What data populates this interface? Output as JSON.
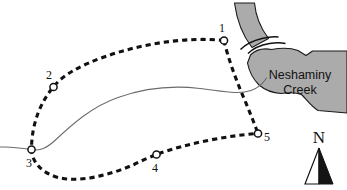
{
  "figure": {
    "name": "neshaminy-creek-sampling-site-map",
    "width": 347,
    "height": 190,
    "background_color": "#ffffff"
  },
  "colors": {
    "water_fill": "#ababab",
    "water_outline": "#1a1a1a",
    "route_line": "#111111",
    "stream_line": "#6b6b6b",
    "marker_fill": "#ffffff",
    "marker_stroke": "#111111",
    "text": "#111111"
  },
  "water_bodies": [
    {
      "name": "neshaminy-creek-upper-channel",
      "label": "",
      "fill": "#ababab"
    },
    {
      "name": "neshaminy-creek-lower-body",
      "label": "Neshaminy Creek",
      "label_line_1": "Neshaminy",
      "label_line_2": "Creek",
      "fill": "#ababab"
    }
  ],
  "creek_label": {
    "line_1": "Neshaminy",
    "line_2": "Creek"
  },
  "route": {
    "name": "dashed-survey-route",
    "style": "dashed",
    "color": "#111111"
  },
  "tributary": {
    "name": "tributary-stream",
    "style": "thin-solid",
    "color": "#6b6b6b"
  },
  "sites": [
    {
      "id": "1",
      "label": "1",
      "cx": 224.0,
      "cy": 40.5,
      "label_x": 219.0,
      "label_y": 32.0
    },
    {
      "id": "2",
      "label": "2",
      "cx": 53.5,
      "cy": 87.0,
      "label_x": 46.0,
      "label_y": 78.5
    },
    {
      "id": "3",
      "label": "3",
      "cx": 31.5,
      "cy": 149.5,
      "label_x": 26.0,
      "label_y": 166.5
    },
    {
      "id": "4",
      "label": "4",
      "cx": 156.5,
      "cy": 154.5,
      "label_x": 152.0,
      "label_y": 171.5
    },
    {
      "id": "5",
      "label": "5",
      "cx": 258.0,
      "cy": 133.5,
      "label_x": 264.0,
      "label_y": 141.0
    }
  ],
  "north_arrow": {
    "name": "north-arrow",
    "letter": "N"
  },
  "bridge": {
    "name": "bridge-crossing",
    "label": ""
  }
}
